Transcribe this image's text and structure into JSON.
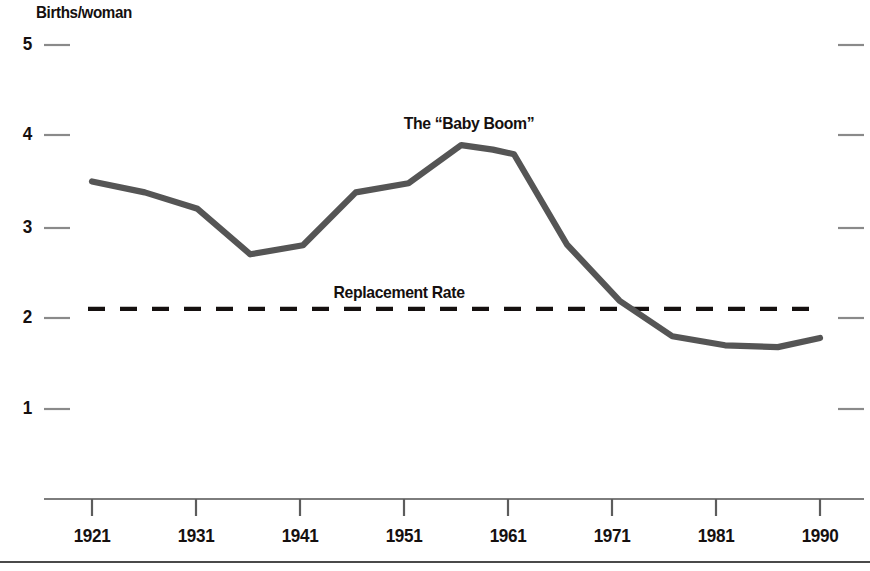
{
  "chart_data": {
    "type": "line",
    "title": "",
    "subtitle": "",
    "xlabel": "",
    "ylabel": "Births/woman",
    "xlim": [
      1921,
      1990
    ],
    "ylim": [
      0.45,
      5.3
    ],
    "grid": false,
    "legend_position": "none",
    "x_ticks": [
      "1921",
      "1931",
      "1941",
      "1951",
      "1961",
      "1971",
      "1981",
      "1990"
    ],
    "x_tick_values": [
      1921,
      1931,
      1941,
      1951,
      1961,
      1971,
      1981,
      1990
    ],
    "y_ticks": [
      "5",
      "4",
      "3",
      "2",
      "1"
    ],
    "y_tick_values": [
      5,
      4,
      3,
      2,
      1
    ],
    "series": [
      {
        "name": "Total fertility rate",
        "color": "#555555",
        "style": "solid",
        "x": [
          1921,
          1926,
          1931,
          1936,
          1941,
          1946,
          1951,
          1956,
          1959,
          1961,
          1966,
          1971,
          1976,
          1981,
          1986,
          1990
        ],
        "values": [
          3.5,
          3.38,
          3.2,
          2.7,
          2.8,
          3.38,
          3.48,
          3.9,
          3.85,
          3.8,
          2.81,
          2.19,
          1.8,
          1.7,
          1.68,
          1.78
        ]
      },
      {
        "name": "Replacement Rate",
        "color": "#15100f",
        "style": "dashed",
        "x": [
          1921,
          1990
        ],
        "values": [
          2.1,
          2.1
        ]
      }
    ],
    "annotations": [
      {
        "name": "baby-boom",
        "text": "The “Baby Boom”",
        "x": 1956,
        "y": 4.08
      },
      {
        "name": "replacement-rate",
        "text": "Replacement Rate",
        "x": 1951,
        "y": 2.35
      }
    ]
  },
  "axis": {
    "y_title": "Births/woman",
    "y_tick_labels": [
      "5",
      "4",
      "3",
      "2",
      "1"
    ],
    "x_tick_labels": [
      "1921",
      "1931",
      "1941",
      "1951",
      "1961",
      "1971",
      "1981",
      "1990"
    ]
  },
  "annotations": {
    "baby_boom": "The “Baby Boom”",
    "replacement_rate": "Replacement Rate"
  },
  "colors": {
    "line": "#555555",
    "text": "#15100f",
    "axis": "#6b6b6b",
    "dashed": "#15100f",
    "background": "#ffffff"
  }
}
